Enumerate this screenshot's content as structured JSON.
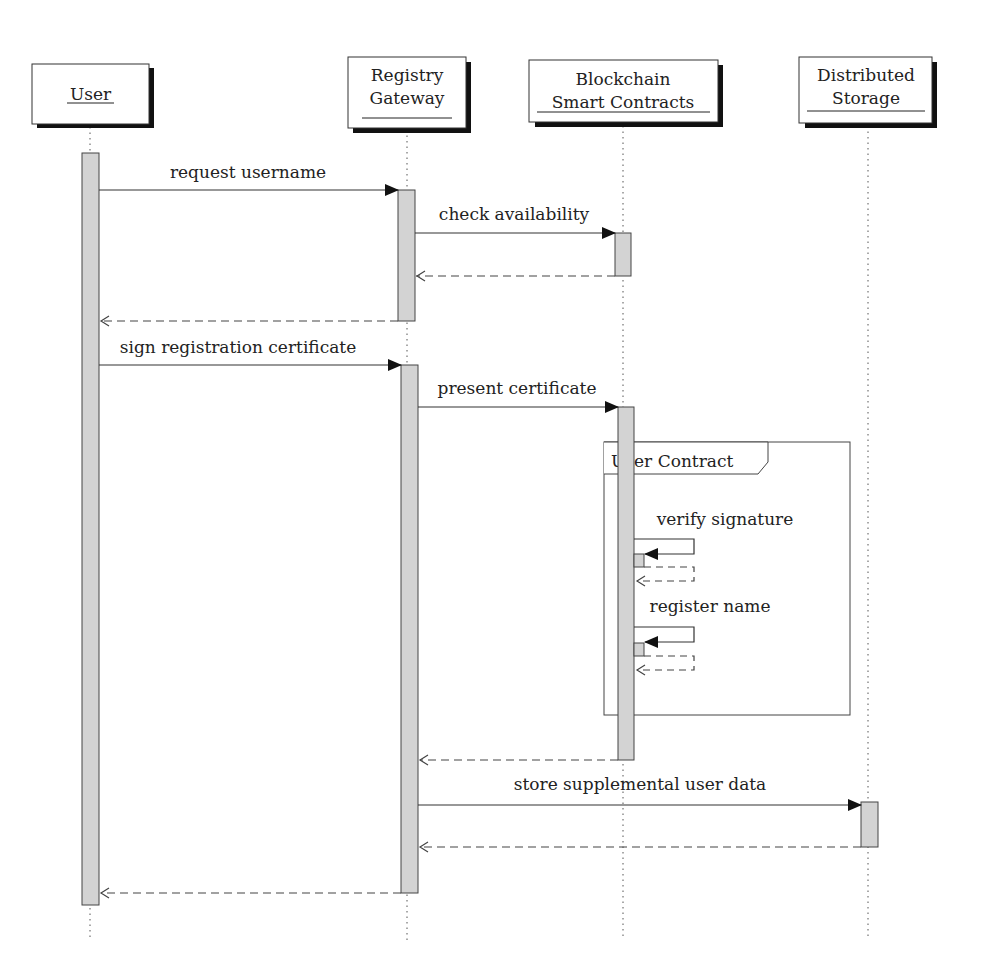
{
  "participants": [
    {
      "id": "user",
      "label_lines": [
        "User"
      ],
      "x": 90
    },
    {
      "id": "gateway",
      "label_lines": [
        "Registry",
        "Gateway"
      ],
      "x": 407
    },
    {
      "id": "blockchain",
      "label_lines": [
        "Blockchain",
        "Smart Contracts"
      ],
      "x": 623
    },
    {
      "id": "storage",
      "label_lines": [
        "Distributed",
        "Storage"
      ],
      "x": 868
    }
  ],
  "messages": [
    {
      "label": "request username",
      "from": "user",
      "to": "gateway",
      "type": "sync"
    },
    {
      "label": "check availability",
      "from": "gateway",
      "to": "blockchain",
      "type": "sync"
    },
    {
      "label": "",
      "from": "blockchain",
      "to": "gateway",
      "type": "return"
    },
    {
      "label": "",
      "from": "gateway",
      "to": "user",
      "type": "return"
    },
    {
      "label": "sign registration certificate",
      "from": "user",
      "to": "gateway",
      "type": "sync"
    },
    {
      "label": "present certificate",
      "from": "gateway",
      "to": "blockchain",
      "type": "sync"
    },
    {
      "label": "verify signature",
      "from": "blockchain",
      "to": "blockchain",
      "type": "self"
    },
    {
      "label": "register name",
      "from": "blockchain",
      "to": "blockchain",
      "type": "self"
    },
    {
      "label": "",
      "from": "blockchain",
      "to": "gateway",
      "type": "return"
    },
    {
      "label": "store supplemental user data",
      "from": "gateway",
      "to": "storage",
      "type": "sync"
    },
    {
      "label": "",
      "from": "storage",
      "to": "gateway",
      "type": "return"
    },
    {
      "label": "",
      "from": "gateway",
      "to": "user",
      "type": "return"
    }
  ],
  "fragments": [
    {
      "label": "User Contract"
    }
  ],
  "colors": {
    "activation_fill": "#d3d3d3",
    "line": "#333333",
    "shadow": "#111111"
  }
}
